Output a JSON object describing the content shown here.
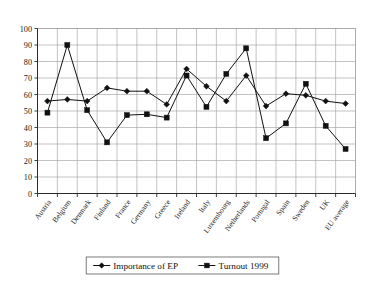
{
  "chart_data": {
    "type": "line",
    "title": "",
    "xlabel": "",
    "ylabel": "",
    "ylim": [
      0,
      100
    ],
    "ytick_step": 10,
    "grid": true,
    "legend_position": "bottom-center",
    "categories": [
      "Austria",
      "Belgium",
      "Denmark",
      "Finland",
      "France",
      "Germany",
      "Greece",
      "Ireland",
      "Italy",
      "Luxembourg",
      "Netherlands",
      "Portugal",
      "Spain",
      "Sweden",
      "UK",
      "EU average"
    ],
    "yticks": [
      0,
      10,
      20,
      30,
      40,
      50,
      60,
      70,
      80,
      90,
      100
    ],
    "series": [
      {
        "name": "Importance of EP",
        "marker": "diamond",
        "color": "#111111",
        "values": [
          56,
          57,
          56,
          64,
          62,
          62,
          54,
          75.5,
          65,
          56,
          71.5,
          53,
          60.5,
          59.5,
          56,
          54.5
        ]
      },
      {
        "name": "Turnout 1999",
        "marker": "square",
        "color": "#111111",
        "values": [
          49,
          90,
          50.5,
          31,
          47.5,
          48,
          46,
          71.5,
          52.5,
          72.5,
          88,
          33.5,
          42.5,
          66.5,
          41,
          27
        ]
      }
    ]
  },
  "legend": {
    "entries": [
      {
        "label": "Importance of EP",
        "marker": "diamond"
      },
      {
        "label": "Turnout 1999",
        "marker": "square"
      }
    ]
  },
  "axes": {
    "y_min_label": "0",
    "y_max_label": "100"
  }
}
